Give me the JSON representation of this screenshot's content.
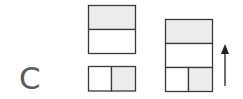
{
  "panel": {
    "label": "C"
  },
  "colors": {
    "stroke": "#3a3a3a",
    "shaded_fill": "#ececec",
    "empty_fill": "#ffffff",
    "label": "#5a5a5a",
    "arrow": "#222222"
  },
  "figures": [
    {
      "id": "top-left-block",
      "description": "two stacked horizontal cells, top shaded",
      "cells": [
        {
          "position": "top",
          "shaded": true
        },
        {
          "position": "bottom",
          "shaded": false
        }
      ]
    },
    {
      "id": "bottom-left-block",
      "description": "two side-by-side cells, right shaded",
      "cells": [
        {
          "position": "left",
          "shaded": false
        },
        {
          "position": "right",
          "shaded": true
        }
      ]
    },
    {
      "id": "combined-block",
      "description": "stack: shaded top cell, empty middle cell, bottom row of two cells with right shaded",
      "cells": [
        {
          "position": "top",
          "shaded": true
        },
        {
          "position": "middle",
          "shaded": false
        },
        {
          "position": "bottom-left",
          "shaded": false
        },
        {
          "position": "bottom-right",
          "shaded": true
        }
      ]
    }
  ],
  "arrow": {
    "direction": "up"
  }
}
